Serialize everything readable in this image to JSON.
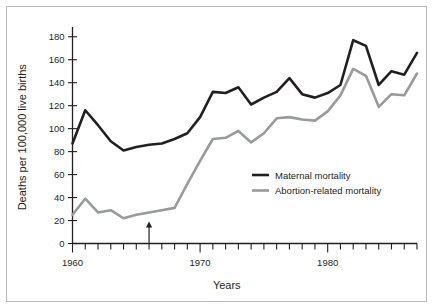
{
  "figure": {
    "background_color": "#ffffff",
    "border_color": "#b9b9b9"
  },
  "chart_data": {
    "type": "line",
    "title": "",
    "xlabel": "Years",
    "ylabel": "Deaths per 100,000 live births",
    "xlim": [
      1960,
      1987
    ],
    "ylim": [
      0,
      185
    ],
    "y_ticks": [
      0,
      20,
      40,
      60,
      80,
      100,
      120,
      140,
      160,
      180
    ],
    "y_tick_labels": [
      "0",
      "20",
      "40",
      "60",
      "80",
      "100",
      "120",
      "140",
      "160",
      "180"
    ],
    "x_ticks": [
      1960,
      1961,
      1962,
      1963,
      1964,
      1965,
      1966,
      1967,
      1968,
      1969,
      1970,
      1971,
      1972,
      1973,
      1974,
      1975,
      1976,
      1977,
      1978,
      1979,
      1980,
      1981,
      1982,
      1983,
      1984,
      1985,
      1986,
      1987
    ],
    "x_tick_labels_shown": [
      {
        "value": 1960,
        "label": "1960"
      },
      {
        "value": 1970,
        "label": "1970"
      },
      {
        "value": 1980,
        "label": "1980"
      }
    ],
    "grid": false,
    "legend_position": "center-right",
    "x": [
      1960,
      1961,
      1962,
      1963,
      1964,
      1965,
      1966,
      1967,
      1968,
      1969,
      1970,
      1971,
      1972,
      1973,
      1974,
      1975,
      1976,
      1977,
      1978,
      1979,
      1980,
      1981,
      1982,
      1983,
      1984,
      1985,
      1986,
      1987
    ],
    "series": [
      {
        "name": "Maternal mortality",
        "color": "#231f20",
        "width": 2.6,
        "values": [
          87,
          116,
          103,
          89,
          81,
          84,
          86,
          87,
          91,
          96,
          110,
          132,
          131,
          136,
          121,
          127,
          132,
          144,
          130,
          127,
          131,
          138,
          177,
          172,
          138,
          150,
          147,
          166
        ]
      },
      {
        "name": "Abortion-related mortality",
        "color": "#999a9a",
        "width": 2.6,
        "values": [
          25,
          39,
          27,
          29,
          22,
          25,
          27,
          29,
          31,
          52,
          72,
          91,
          92,
          98,
          88,
          96,
          109,
          110,
          108,
          107,
          115,
          129,
          152,
          146,
          119,
          130,
          129,
          148
        ]
      }
    ],
    "annotations": [
      {
        "name": "year-marker-arrow",
        "type": "up-arrow",
        "x_value": 1966,
        "y_value": 0,
        "height": 22,
        "color": "#231f20"
      }
    ]
  },
  "legend": {
    "items": [
      {
        "label": "Maternal mortality",
        "color": "#231f20"
      },
      {
        "label": "Abortion-related mortality",
        "color": "#999a9a"
      }
    ]
  }
}
